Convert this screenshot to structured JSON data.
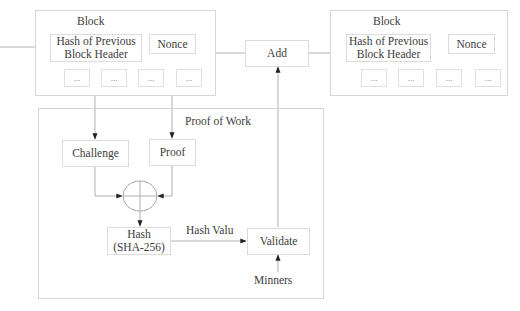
{
  "diagram": {
    "blocks": [
      {
        "title": "Block",
        "header_field": "Hash of Previous Block Header",
        "header_line1": "Hash of Previous",
        "header_line2": "Block Header",
        "nonce": "Nonce",
        "fields": [
          "...",
          "...",
          "...",
          "..."
        ]
      },
      {
        "title": "Block",
        "header_field": "Hash of Previous Block Header",
        "header_line1": "Hash of Previous",
        "header_line2": "Block Header",
        "nonce": "Nonce",
        "fields": [
          "...",
          "...",
          "...",
          "..."
        ]
      }
    ],
    "add": "Add",
    "proof_of_work": {
      "title": "Proof of Work",
      "challenge": "Challenge",
      "proof": "Proof",
      "hash_line1": "Hash",
      "hash_line2": "(SHA-256)",
      "hash_value_label": "Hash Valu",
      "validate": "Validate",
      "miners": "Minners"
    },
    "colors": {
      "border": "#d6d6d6",
      "line": "#9a9a9a",
      "arrow": "#222222",
      "text": "#3c3c3c"
    }
  }
}
